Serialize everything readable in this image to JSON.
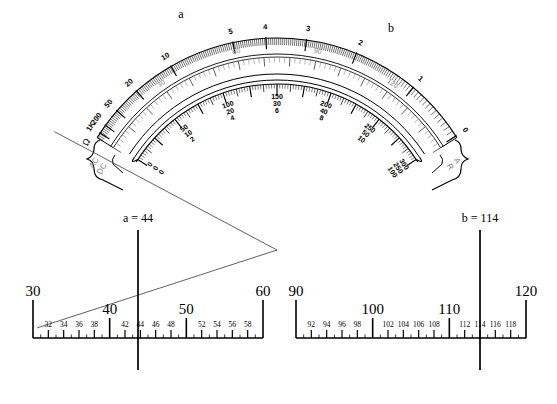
{
  "figure": {
    "background": "#ffffff",
    "ink": "#000000",
    "gray_ink": "#808080"
  },
  "meter": {
    "name": "multimeter-dial-face",
    "center": {
      "x": 277,
      "y": 250
    },
    "pointers": [
      {
        "id": "a",
        "label": "a",
        "angle_deg": -108,
        "label_x": 181,
        "label_y": 18,
        "tip_x": 200,
        "tip_y": 27
      },
      {
        "id": "b",
        "label": "b",
        "angle_deg": -62,
        "label_x": 391,
        "label_y": 32,
        "tip_x": 381,
        "tip_y": 40
      }
    ],
    "scales": [
      {
        "name": "ohms-scale",
        "unit": "Ω",
        "direction": "right-to-left",
        "labels": [
          "1K",
          "200",
          "50",
          "20",
          "10",
          "5",
          "4",
          "3",
          "2",
          "1",
          "0"
        ]
      },
      {
        "name": "dc-volts-scale",
        "labels": [
          "0",
          "30",
          "60",
          "90",
          "120",
          "150"
        ]
      },
      {
        "name": "ac-dc-multi-scale",
        "label_groups": [
          {
            "top": "0",
            "mid": "0",
            "bot": "0"
          },
          {
            "top": "50",
            "mid": "10",
            "bot": "2"
          },
          {
            "top": "100",
            "mid": "20",
            "bot": "4"
          },
          {
            "top": "150",
            "mid": "30",
            "bot": "6"
          },
          {
            "top": "200",
            "mid": "40",
            "bot": "8"
          },
          {
            "top": "250",
            "mid": "50",
            "bot": "10"
          },
          {
            "top": "300",
            "mid": "250",
            "bot": "100"
          }
        ]
      }
    ],
    "brackets": [
      {
        "name": "left-bracket",
        "lines": [
          "AC",
          "DC"
        ]
      },
      {
        "name": "right-bracket",
        "lines": [
          "A",
          "R"
        ]
      }
    ]
  },
  "numberlines": [
    {
      "name": "numberline-a",
      "id": "left",
      "min": 30,
      "max": 60,
      "x_start": 33,
      "x_end": 263,
      "baseline_y": 338,
      "major_labels": [
        "30",
        "40",
        "50",
        "60"
      ],
      "major_values": [
        30,
        40,
        50,
        60
      ],
      "minor_labels": [
        "32",
        "34",
        "36",
        "38",
        "42",
        "44",
        "46",
        "48",
        "52",
        "54",
        "56",
        "58"
      ],
      "minor_values": [
        32,
        34,
        36,
        38,
        42,
        44,
        46,
        48,
        52,
        54,
        56,
        58
      ],
      "indicator": {
        "name": "indicator-a",
        "label": "a = 44",
        "value": 44,
        "x": 138,
        "label_x": 138,
        "label_y": 222,
        "y_top": 230,
        "y_bottom": 370
      }
    },
    {
      "name": "numberline-b",
      "id": "right",
      "min": 90,
      "max": 120,
      "x_start": 296,
      "x_end": 526,
      "baseline_y": 338,
      "major_labels": [
        "90",
        "100",
        "110",
        "120"
      ],
      "major_values": [
        90,
        100,
        110,
        120
      ],
      "minor_labels": [
        "92",
        "94",
        "96",
        "98",
        "102",
        "104",
        "106",
        "108",
        "112",
        "114",
        "116",
        "118"
      ],
      "minor_values": [
        92,
        94,
        96,
        98,
        102,
        104,
        106,
        108,
        112,
        114,
        116,
        118
      ],
      "indicator": {
        "name": "indicator-b",
        "label": "b = 114",
        "value": 114,
        "x": 480,
        "label_x": 480,
        "label_y": 222,
        "y_top": 230,
        "y_bottom": 370
      }
    }
  ]
}
